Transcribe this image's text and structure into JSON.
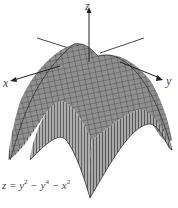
{
  "figure": {
    "type": "3d-surface-plot",
    "axes": {
      "x_label": "x",
      "y_label": "y",
      "z_label": "z"
    },
    "equation": {
      "lhs": "z = y",
      "y_sq_exp": "2",
      "mid1": " − y",
      "y_4_exp": "4",
      "mid2": " − x",
      "x_sq_exp": "2",
      "full": "z = y^2 − y^4 − x^2"
    },
    "colors": {
      "surface_light": "#cfcfcf",
      "surface_dark": "#6e6e6e",
      "mesh": "#333333",
      "axis": "#333333"
    }
  }
}
